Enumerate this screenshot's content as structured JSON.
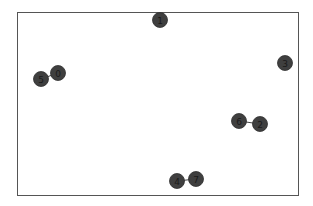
{
  "graph": {
    "frame": {
      "x": 17,
      "y": 12,
      "width": 281,
      "height": 183,
      "stroke": "#555555"
    },
    "node_style": {
      "fill": "#3f3f3f",
      "stroke": "#2e2e2e",
      "radius": 7.5,
      "label_color": "#1a1a1a"
    },
    "edge_style": {
      "stroke": "#444444",
      "width": 1
    },
    "nodes": [
      {
        "id": "0",
        "label": "0",
        "x": 58,
        "y": 73
      },
      {
        "id": "1",
        "label": "1",
        "x": 160,
        "y": 20
      },
      {
        "id": "2",
        "label": "2",
        "x": 260,
        "y": 124
      },
      {
        "id": "3",
        "label": "3",
        "x": 285,
        "y": 63
      },
      {
        "id": "4",
        "label": "4",
        "x": 177,
        "y": 181
      },
      {
        "id": "5",
        "label": "5",
        "x": 41,
        "y": 79
      },
      {
        "id": "6",
        "label": "6",
        "x": 239,
        "y": 121
      },
      {
        "id": "7",
        "label": "7",
        "x": 196,
        "y": 179
      }
    ],
    "edges": [
      {
        "source": "5",
        "target": "0"
      },
      {
        "source": "6",
        "target": "2"
      },
      {
        "source": "4",
        "target": "7"
      }
    ]
  }
}
